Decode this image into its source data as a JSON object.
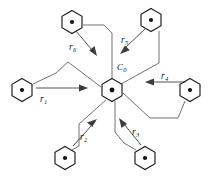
{
  "figure": {
    "kind": "hexagonal-cell-vector-diagram",
    "width": 211,
    "height": 178,
    "background_color": "#ffffff",
    "stroke_color": "#1b1b1b",
    "link_color": "#55585c",
    "arrow_color": "#3a3d41",
    "center_cell": {
      "name": "center-cell",
      "label_base": "C",
      "label_sub": "0",
      "label_full": "C0",
      "cx": 112,
      "cy": 90,
      "radius": 11.5
    },
    "neighbor_cells": [
      {
        "name": "cell-upper-left",
        "cx": 72,
        "cy": 22,
        "radius": 11.5
      },
      {
        "name": "cell-upper-right",
        "cx": 151,
        "cy": 20,
        "radius": 11.5
      },
      {
        "name": "cell-right",
        "cx": 190,
        "cy": 90,
        "radius": 11.5
      },
      {
        "name": "cell-lower-right",
        "cx": 145,
        "cy": 158,
        "radius": 11.5
      },
      {
        "name": "cell-lower-left",
        "cx": 65,
        "cy": 158,
        "radius": 11.5
      },
      {
        "name": "cell-left",
        "cx": 22,
        "cy": 90,
        "radius": 11.5
      }
    ],
    "vectors": [
      {
        "name": "vector-r1",
        "base": "r",
        "sub": "1",
        "label_full": "r1",
        "label_x": 40,
        "label_y": 95,
        "direction": "right"
      },
      {
        "name": "vector-r2",
        "base": "r",
        "sub": "2",
        "label_full": "r2",
        "label_x": 80,
        "label_y": 133,
        "direction": "up-right"
      },
      {
        "name": "vector-r3",
        "base": "r",
        "sub": "3",
        "label_full": "r3",
        "label_x": 132,
        "label_y": 128,
        "direction": "up-left"
      },
      {
        "name": "vector-r4",
        "base": "r",
        "sub": "4",
        "label_full": "r4",
        "label_x": 161,
        "label_y": 72,
        "direction": "left"
      },
      {
        "name": "vector-r5",
        "base": "r",
        "sub": "5",
        "label_full": "r5",
        "label_x": 121,
        "label_y": 36,
        "direction": "down-left"
      },
      {
        "name": "vector-r6",
        "base": "r",
        "sub": "6",
        "label_full": "r6",
        "label_x": 69,
        "label_y": 43,
        "direction": "down-right"
      }
    ]
  }
}
